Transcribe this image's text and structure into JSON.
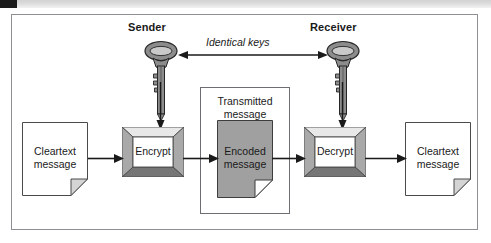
{
  "page": {
    "colors": {
      "line": "#1a1a1a",
      "frame_border": "#8f8f93",
      "box_border": "#6e6e72",
      "bevel_light": "#e8e8e8",
      "bevel_mid": "#a9a9a9",
      "bevel_dark": "#767676",
      "encoded_fill": "#a0a0a0",
      "key_fill": "#8c8c8c",
      "top_tab": "#1b1b1b",
      "top_bar": "#dcdcdc",
      "paper_white": "#ffffff"
    }
  },
  "top_bar": {
    "tab_label": "",
    "bar_label": ""
  },
  "diagram": {
    "roles": {
      "sender": "Sender",
      "receiver": "Receiver"
    },
    "key_relationship_label": "Identical keys",
    "nodes": {
      "cleartext_in": "Cleartext\nmessage",
      "encrypt": "Encrypt",
      "transmitted": "Transmitted\nmessage",
      "encoded": "Encoded\nmessage",
      "decrypt": "Decrypt",
      "cleartext_out": "Cleartext\nmessage"
    },
    "icons": {
      "sender_key": "key-icon",
      "receiver_key": "key-icon",
      "identical_keys_arrow": "double-arrow-icon",
      "sender_key_arrow": "arrow-down-icon",
      "receiver_key_arrow": "arrow-down-icon",
      "flow_arrow": "arrow-right-icon"
    },
    "flow": [
      {
        "from": "cleartext_in",
        "to": "encrypt"
      },
      {
        "from": "encrypt",
        "to": "encoded"
      },
      {
        "from": "encoded",
        "to": "decrypt"
      },
      {
        "from": "decrypt",
        "to": "cleartext_out"
      }
    ]
  }
}
